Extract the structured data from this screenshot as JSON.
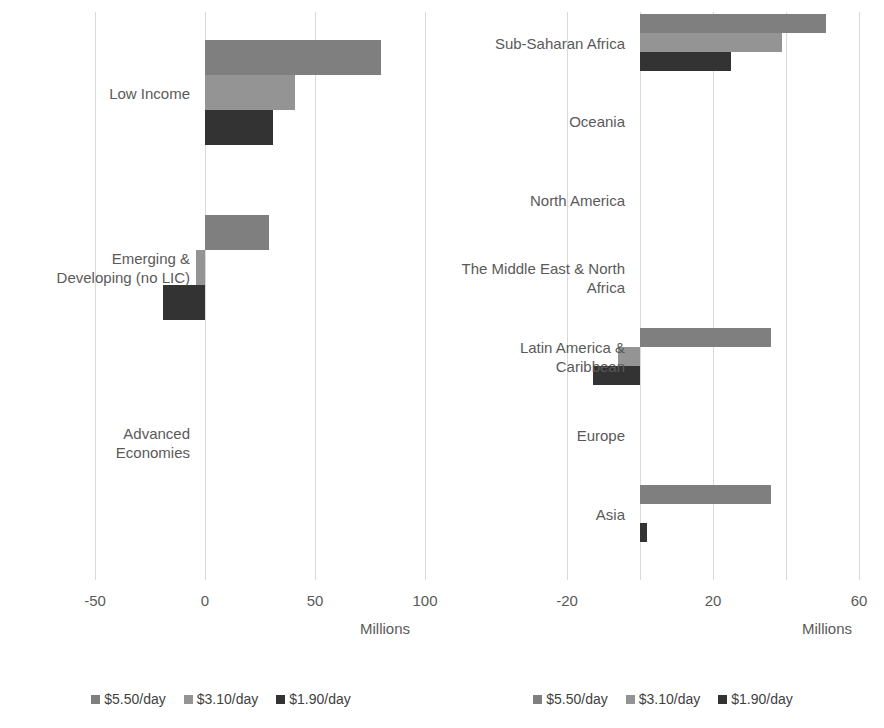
{
  "chart_data": [
    {
      "type": "bar",
      "orientation": "horizontal",
      "id": "left",
      "title": "",
      "xlabel": "Millions",
      "ylabel": "",
      "xlim": [
        -75,
        110
      ],
      "xticks": [
        -50,
        0,
        50,
        100
      ],
      "xticklabels": [
        "-50",
        "0",
        "50",
        "100"
      ],
      "grid": true,
      "legend_position": "bottom",
      "categories": [
        "Low Income",
        "Emerging &\nDeveloping (no LIC)",
        "Advanced\nEconomies"
      ],
      "series": [
        {
          "name": "$5.50/day",
          "color": "#7f7f7f",
          "values": [
            80,
            29,
            0
          ]
        },
        {
          "name": "$3.10/day",
          "color": "#949494",
          "values": [
            41,
            -4,
            0
          ]
        },
        {
          "name": "$1.90/day",
          "color": "#333333",
          "values": [
            31,
            -19,
            0
          ]
        }
      ]
    },
    {
      "type": "bar",
      "orientation": "horizontal",
      "id": "right",
      "title": "",
      "xlabel": "Millions",
      "ylabel": "",
      "xlim": [
        -28,
        64
      ],
      "xticks": [
        -20,
        0,
        20,
        40,
        60
      ],
      "xticklabels": [
        "-20",
        "0",
        "20",
        "",
        "60"
      ],
      "grid": true,
      "legend_position": "bottom",
      "categories": [
        "Sub-Saharan Africa",
        "Oceania",
        "North America",
        "The Middle East & North\nAfrica",
        "Latin America &\nCaribbean",
        "Europe",
        "Asia"
      ],
      "series": [
        {
          "name": "$5.50/day",
          "color": "#7f7f7f",
          "values": [
            51,
            0,
            0,
            0,
            36,
            0,
            36
          ]
        },
        {
          "name": "$3.10/day",
          "color": "#949494",
          "values": [
            39,
            0,
            0,
            0,
            -6,
            0,
            0
          ]
        },
        {
          "name": "$1.90/day",
          "color": "#333333",
          "values": [
            25,
            0,
            0,
            0,
            -13,
            0,
            2
          ]
        }
      ]
    }
  ],
  "left_panel": {
    "axis_title": "Millions",
    "tick_labels": [
      "-50",
      "0",
      "50",
      "100"
    ],
    "categories": [
      {
        "label": "Low Income"
      },
      {
        "label": "Emerging &\nDeveloping (no LIC)"
      },
      {
        "label": "Advanced\nEconomies"
      }
    ],
    "legend": [
      {
        "label": "$5.50/day",
        "color": "#7f7f7f"
      },
      {
        "label": "$3.10/day",
        "color": "#949494"
      },
      {
        "label": "$1.90/day",
        "color": "#333333"
      }
    ]
  },
  "right_panel": {
    "axis_title": "Millions",
    "tick_labels": [
      "-20",
      "20",
      "60"
    ],
    "categories": [
      {
        "label": "Sub-Saharan Africa"
      },
      {
        "label": "Oceania"
      },
      {
        "label": "North America"
      },
      {
        "label": "The Middle East & North\nAfrica"
      },
      {
        "label": "Latin America &\nCaribbean"
      },
      {
        "label": "Europe"
      },
      {
        "label": "Asia"
      }
    ],
    "legend": [
      {
        "label": "$5.50/day",
        "color": "#7f7f7f"
      },
      {
        "label": "$3.10/day",
        "color": "#949494"
      },
      {
        "label": "$1.90/day",
        "color": "#333333"
      }
    ]
  }
}
